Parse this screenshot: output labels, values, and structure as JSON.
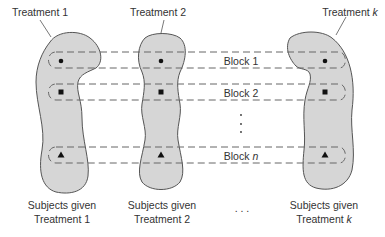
{
  "diagram": {
    "title_labels": {
      "treatment_1": "Treatment 1",
      "treatment_2": "Treatment 2",
      "treatment_k_prefix": "Treatment ",
      "treatment_k_var": "k"
    },
    "blocks": [
      {
        "label_prefix": "Block ",
        "label_var": "1",
        "marker": "circle"
      },
      {
        "label_prefix": "Block ",
        "label_var": "2",
        "marker": "square"
      },
      {
        "label_prefix": "Block ",
        "label_var": "n",
        "marker": "triangle"
      }
    ],
    "vertical_ellipsis": "⋮",
    "bottom_labels": {
      "group_1_line1": "Subjects given",
      "group_1_line2": "Treatment 1",
      "group_2_line1": "Subjects given",
      "group_2_line2": "Treatment 2",
      "ellipsis": ". . .",
      "group_k_line1": "Subjects given",
      "group_k_line2_prefix": "Treatment ",
      "group_k_line2_var": "k"
    },
    "colors": {
      "blob_fill": "#d6d6d6",
      "blob_stroke": "#555555",
      "dash": "#666666",
      "text": "#333333"
    }
  }
}
